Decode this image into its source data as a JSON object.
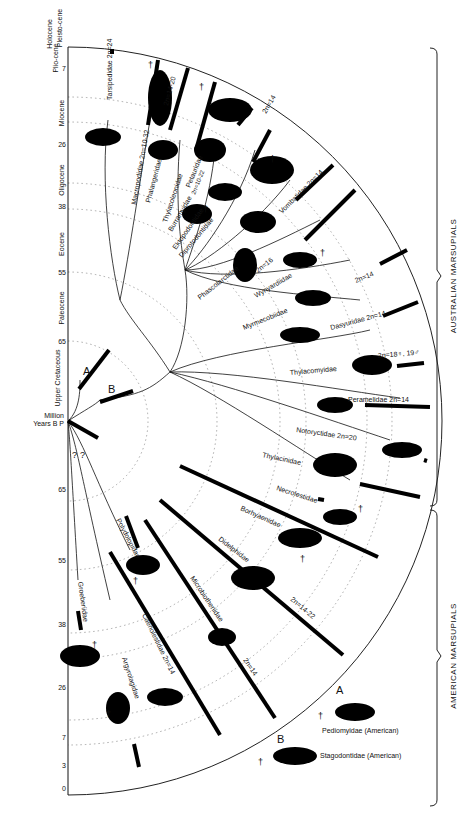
{
  "diagram": {
    "axis": {
      "label_line1": "Million",
      "label_line2": "Years B P",
      "ticks_upper": [
        "0",
        "3",
        "7",
        "26",
        "38",
        "55",
        "65"
      ],
      "ticks_lower": [
        "65",
        "55",
        "38",
        "26",
        "7",
        "3",
        "0"
      ],
      "epochs": [
        {
          "name": "Holocene"
        },
        {
          "name": "Pleisto-cene"
        },
        {
          "name": "Plio-cene"
        },
        {
          "name": "Miocene"
        },
        {
          "name": "Oligocene"
        },
        {
          "name": "Eocene"
        },
        {
          "name": "Paleocene"
        },
        {
          "name": "Upper Cretaceous"
        }
      ]
    },
    "groups": {
      "australian": "AUSTRALIAN MARSUPIALS",
      "american": "AMERICAN MARSUPIALS"
    },
    "ancestors": {
      "a_label": "A",
      "b_label": "B",
      "question1": "?",
      "question2": "?"
    },
    "families": [
      {
        "name": "Tarsipedidae",
        "karyotype": "2n=24"
      },
      {
        "name": "Macropodidae",
        "karyotype": "2n=10-32"
      },
      {
        "name": "Phalangeridae",
        "karyotype": "2n=14-20"
      },
      {
        "name": "Thylacoleonidae",
        "karyotype": ""
      },
      {
        "name": "Petauridae",
        "karyotype": "2n=10-22"
      },
      {
        "name": "Burramyidae",
        "karyotype": "2n=14"
      },
      {
        "name": "Ektopodontidae",
        "karyotype": ""
      },
      {
        "name": "Diprotodontidae",
        "karyotype": ""
      },
      {
        "name": "Vombatidae",
        "karyotype": "2n=14"
      },
      {
        "name": "Phascolarctidae",
        "karyotype": "2n=16"
      },
      {
        "name": "Wynyardiidae",
        "karyotype": ""
      },
      {
        "name": "Myrmecobiidae",
        "karyotype": "2n=14"
      },
      {
        "name": "Dasyuridae",
        "karyotype": "2n=14"
      },
      {
        "name": "Thylacomyidae",
        "karyotype": "2n=18♀, 19♂"
      },
      {
        "name": "Peramelidae",
        "karyotype": "2n=14"
      },
      {
        "name": "Notoryctidae",
        "karyotype": "2n=20"
      },
      {
        "name": "Thylacinidae",
        "karyotype": ""
      },
      {
        "name": "Necrolestidae",
        "karyotype": ""
      },
      {
        "name": "Borhyaenidae",
        "karyotype": ""
      },
      {
        "name": "Didelphidae",
        "karyotype": "2n=14-22"
      },
      {
        "name": "Microbiotheriidae",
        "karyotype": "2n=14"
      },
      {
        "name": "Polydolopidae",
        "karyotype": ""
      },
      {
        "name": "Caenolestidae",
        "karyotype": "2n=14"
      },
      {
        "name": "Argyrolagidae",
        "karyotype": ""
      },
      {
        "name": "Groeberiidae",
        "karyotype": ""
      }
    ],
    "legend": {
      "a_letter": "A",
      "a_text": "Pediomyidae (American)",
      "b_letter": "B",
      "b_text": "Stagodontidae (American)",
      "extinct_symbol": "†"
    }
  }
}
